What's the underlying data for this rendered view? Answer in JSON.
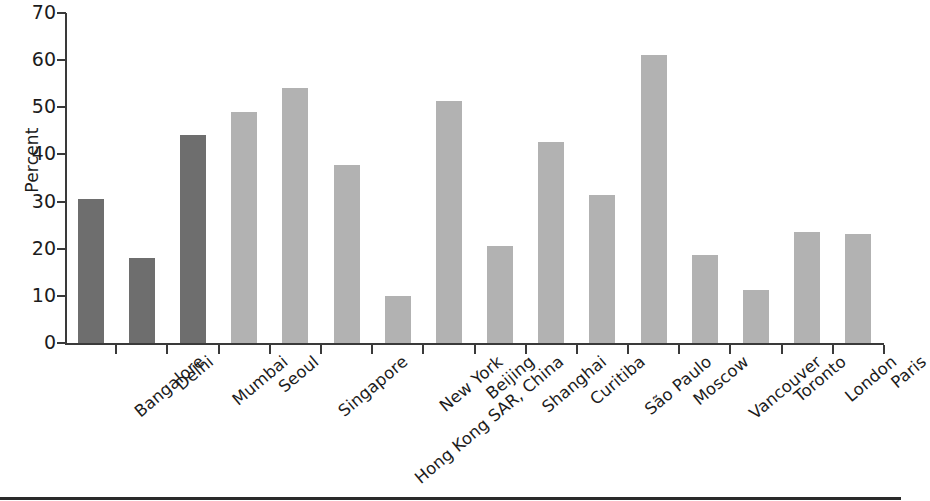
{
  "chart_data": {
    "type": "bar",
    "title": "",
    "xlabel": "",
    "ylabel": "Percent",
    "ylim": [
      0,
      70
    ],
    "yticks": [
      0,
      10,
      20,
      30,
      40,
      50,
      60,
      70
    ],
    "grid": false,
    "legend": "none",
    "categories": [
      "Bangalore",
      "Delhi",
      "Mumbai",
      "Seoul",
      "Singapore",
      "Hong Kong SAR, China",
      "New York",
      "Beijing",
      "Shanghai",
      "Curitiba",
      "São Paulo",
      "Moscow",
      "Vancouver",
      "Toronto",
      "London",
      "Paris"
    ],
    "values": [
      30.5,
      18.0,
      44.2,
      49.0,
      54.0,
      37.8,
      10.0,
      51.3,
      20.6,
      42.7,
      31.3,
      61.0,
      18.6,
      11.3,
      23.5,
      23.2
    ],
    "bar_colors": [
      "#6e6e6e",
      "#6e6e6e",
      "#6e6e6e",
      "#b2b2b2",
      "#b2b2b2",
      "#b2b2b2",
      "#b2b2b2",
      "#b2b2b2",
      "#b2b2b2",
      "#b2b2b2",
      "#b2b2b2",
      "#b2b2b2",
      "#b2b2b2",
      "#b2b2b2",
      "#b2b2b2",
      "#b2b2b2"
    ],
    "series": [
      {
        "name": "Percent",
        "values": [
          30.5,
          18.0,
          44.2,
          49.0,
          54.0,
          37.8,
          10.0,
          51.3,
          20.6,
          42.7,
          31.3,
          61.0,
          18.6,
          11.3,
          23.5,
          23.2
        ]
      }
    ],
    "axis_color": "#3a3a3a",
    "text_color": "#1c1c1c"
  }
}
